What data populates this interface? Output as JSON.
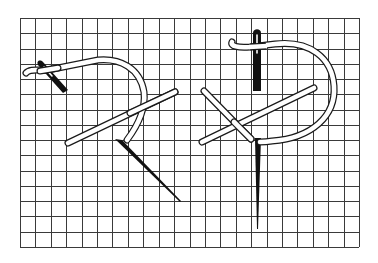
{
  "figure": {
    "title": "Needlework stitch diagram on canvas grid",
    "background": "#ffffff",
    "grid": {
      "x0": 20,
      "y0": 18,
      "x1": 359,
      "y1": 247,
      "cols": 22,
      "rows": 15,
      "line_color": "#3a3a3a"
    },
    "left_stitch": {
      "label": "Left stitch sequence with needle entering thread loop",
      "thread_color": "#ffffff",
      "outline_color": "#1a1a1a",
      "needle_color": "#111111"
    },
    "right_stitch": {
      "label": "Right stitch sequence with vertical needle",
      "thread_color": "#ffffff",
      "outline_color": "#1a1a1a",
      "needle_color": "#111111"
    }
  }
}
